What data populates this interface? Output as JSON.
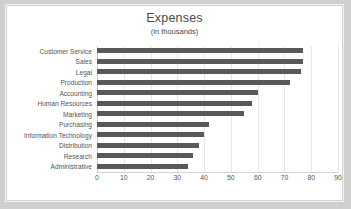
{
  "chart_data": {
    "type": "bar",
    "orientation": "horizontal",
    "title": "Expenses",
    "subtitle": "(in thousands)",
    "xlabel": "",
    "ylabel": "",
    "xlim": [
      0,
      90
    ],
    "xticks": [
      0,
      10,
      20,
      30,
      40,
      50,
      60,
      70,
      80,
      90
    ],
    "grid": true,
    "legend": false,
    "bar_color": "#595959",
    "categories": [
      "Customer Service",
      "Sales",
      "Legal",
      "Production",
      "Accounting",
      "Human Resources",
      "Marketing",
      "Purchasing",
      "Information Technology",
      "Distribution",
      "Research",
      "Administrative"
    ],
    "values": [
      77,
      77,
      76,
      72,
      60,
      58,
      55,
      42,
      40,
      38,
      36,
      34
    ]
  }
}
